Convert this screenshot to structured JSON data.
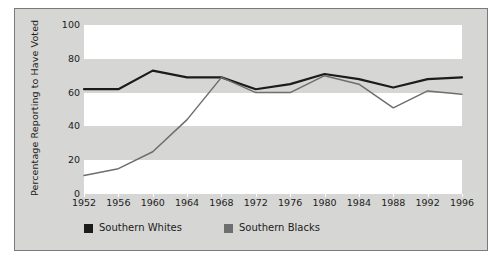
{
  "chart_data": {
    "type": "line",
    "title": "",
    "xlabel": "",
    "ylabel": "Percentage Reporting to Have Voted",
    "categories": [
      "1952",
      "1956",
      "1960",
      "1964",
      "1968",
      "1972",
      "1976",
      "1980",
      "1984",
      "1988",
      "1992",
      "1996"
    ],
    "xlim": [
      1952,
      1996
    ],
    "ylim": [
      0,
      100
    ],
    "yticks": [
      0,
      20,
      40,
      60,
      80,
      100
    ],
    "grid": true,
    "legend_position": "bottom-left",
    "series": [
      {
        "name": "Southern Whites",
        "color": "#1c1c1c",
        "values": [
          62,
          62,
          73,
          69,
          69,
          62,
          65,
          71,
          68,
          63,
          68,
          69
        ]
      },
      {
        "name": "Southern Blacks",
        "color": "#6e6e6e",
        "values": [
          11,
          15,
          25,
          44,
          69,
          60,
          60,
          70,
          65,
          51,
          61,
          59
        ]
      }
    ]
  },
  "legend": {
    "items": [
      {
        "label": "Southern Whites",
        "swatch_color": "#1c1c1c"
      },
      {
        "label": "Southern Blacks",
        "swatch_color": "#6e6e6e"
      }
    ]
  },
  "axes": {
    "y_title": "Percentage Reporting to Have Voted",
    "y_ticklabels": [
      "100",
      "80",
      "60",
      "40",
      "20",
      "0"
    ],
    "x_ticklabels": [
      "1952",
      "1956",
      "1960",
      "1964",
      "1968",
      "1972",
      "1976",
      "1980",
      "1984",
      "1988",
      "1992",
      "1996"
    ]
  }
}
